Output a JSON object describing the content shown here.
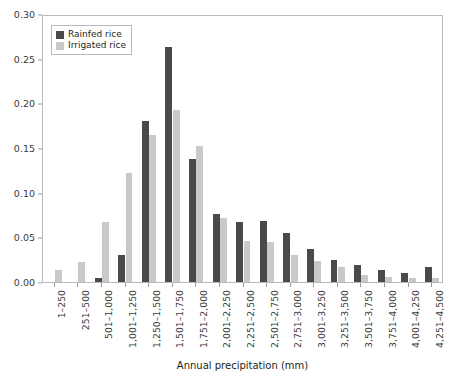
{
  "chart_data": {
    "type": "bar",
    "title": "",
    "subtitle": "",
    "xlabel": "Annual precipitation (mm)",
    "ylabel": "",
    "ylim": [
      0,
      0.3
    ],
    "grid": false,
    "legend_position": "top-left",
    "y_ticks": [
      "0.00",
      "0.05",
      "0.10",
      "0.15",
      "0.20",
      "0.25",
      "0.30"
    ],
    "y_tick_values": [
      0,
      0.05,
      0.1,
      0.15,
      0.2,
      0.25,
      0.3
    ],
    "categories": [
      "1–250",
      "251–500",
      "501–1,000",
      "1,001–1,250",
      "1,250–1,500",
      "1,501–1,750",
      "1,751–2,000",
      "2,001–2,250",
      "2,251–2,500",
      "2,501–2,750",
      "2,751–3,000",
      "3,001–3,250",
      "3,251–3,500",
      "3,501–3,750",
      "3,751–4,000",
      "4,001–4,250",
      "4,251–4,500"
    ],
    "series": [
      {
        "name": "Rainfed rice",
        "color": "#4a4a4a",
        "values": [
          0.0,
          0.0,
          0.005,
          0.03,
          0.18,
          0.263,
          0.138,
          0.076,
          0.067,
          0.068,
          0.055,
          0.037,
          0.025,
          0.019,
          0.014,
          0.01,
          0.017
        ]
      },
      {
        "name": "Irrigated rice",
        "color": "#c9c9c9",
        "values": [
          0.014,
          0.022,
          0.067,
          0.122,
          0.165,
          0.192,
          0.152,
          0.072,
          0.046,
          0.045,
          0.03,
          0.023,
          0.017,
          0.008,
          0.006,
          0.005,
          0.004
        ]
      }
    ]
  },
  "legend": {
    "items": [
      {
        "label": "Rainfed rice",
        "color": "#4a4a4a"
      },
      {
        "label": "Irrigated rice",
        "color": "#c9c9c9"
      }
    ]
  },
  "axes": {
    "x_title": "Annual precipitation (mm)"
  }
}
